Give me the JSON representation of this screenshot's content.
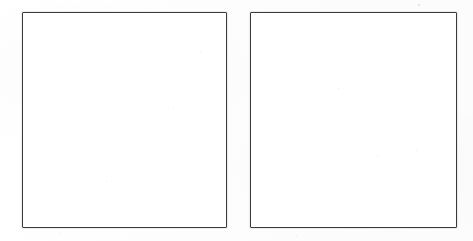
{
  "sheet": {
    "title": "Two Blank Panels",
    "width": 473,
    "height": 241,
    "background_color": "#fdfdfd",
    "description": "Scanned sheet containing two empty rectangular frames side by side",
    "medium": "scanned line drawing"
  },
  "stroke": {
    "color": "#3b3b3b",
    "width_px": 1.8,
    "style": "solid"
  },
  "panels": [
    {
      "id": "panel-left",
      "label": "",
      "content": "",
      "fill_color": "#ffffff",
      "border_color": "#3b3b3b",
      "x": 22,
      "y": 12,
      "width": 205,
      "height": 216,
      "state": "empty"
    },
    {
      "id": "panel-right",
      "label": "",
      "content": "",
      "fill_color": "#ffffff",
      "border_color": "#3b3b3b",
      "x": 250,
      "y": 12,
      "width": 207,
      "height": 216,
      "state": "empty"
    }
  ],
  "artifacts": {
    "note": "faint scanner specks, no text present on the sheet",
    "specks": [
      {
        "x": 418,
        "y": 4,
        "size": 1.6
      },
      {
        "x": 200,
        "y": 52,
        "size": 1.2
      },
      {
        "x": 173,
        "y": 108,
        "size": 1.1
      },
      {
        "x": 106,
        "y": 181,
        "size": 1.3
      },
      {
        "x": 338,
        "y": 88,
        "size": 1.2
      },
      {
        "x": 416,
        "y": 150,
        "size": 1.4
      },
      {
        "x": 377,
        "y": 156,
        "size": 1.0
      },
      {
        "x": 60,
        "y": 233,
        "size": 1.1
      },
      {
        "x": 296,
        "y": 236,
        "size": 1.2
      }
    ]
  }
}
